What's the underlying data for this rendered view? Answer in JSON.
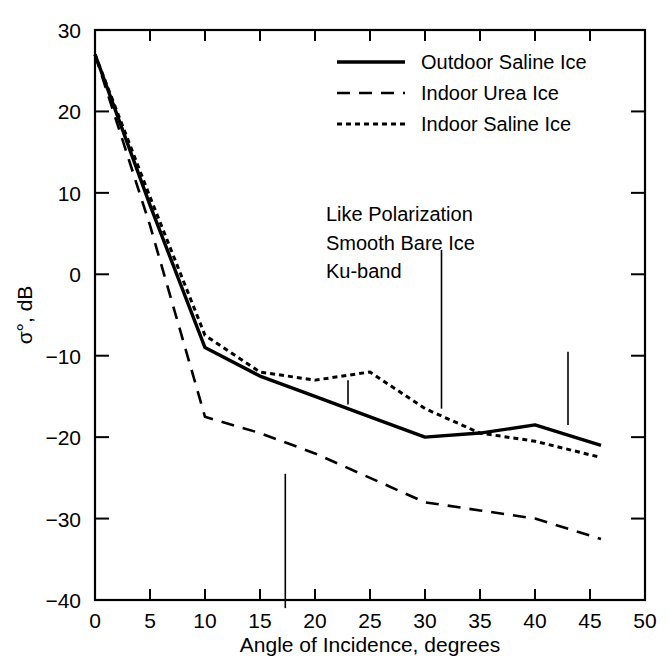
{
  "chart_data": {
    "type": "line",
    "title": "",
    "xlabel": "Angle of Incidence, degrees",
    "ylabel": "σ°, dB",
    "xlim": [
      0,
      50
    ],
    "ylim": [
      -40,
      30
    ],
    "xticks": [
      0,
      5,
      10,
      15,
      20,
      25,
      30,
      35,
      40,
      45,
      50
    ],
    "xticklabels": [
      "0",
      "5",
      "10",
      "15",
      "20",
      "25",
      "30",
      "35",
      "40",
      "45",
      "50"
    ],
    "yticks": [
      -40,
      -30,
      -20,
      -10,
      0,
      10,
      20,
      30
    ],
    "yticklabels": [
      "-40",
      "-30",
      "-20",
      "-10",
      "0",
      "10",
      "20",
      "30"
    ],
    "grid": false,
    "legend_position": "top-right",
    "series": [
      {
        "name": "Outdoor Saline Ice",
        "style": "solid",
        "x": [
          0,
          5,
          10,
          15,
          20,
          25,
          30,
          35,
          40,
          46
        ],
        "y": [
          27.0,
          8.5,
          -9.0,
          -12.5,
          -15.0,
          -17.5,
          -20.0,
          -19.5,
          -18.5,
          -21.0
        ]
      },
      {
        "name": "Indoor Urea Ice",
        "style": "dashed",
        "x": [
          0,
          5,
          10,
          15,
          20,
          25,
          30,
          35,
          40,
          46
        ],
        "y": [
          27.0,
          6.0,
          -17.5,
          -19.5,
          -22.0,
          -25.0,
          -28.0,
          -29.0,
          -30.0,
          -32.5
        ]
      },
      {
        "name": "Indoor Saline Ice",
        "style": "dotted",
        "x": [
          0,
          5,
          10,
          15,
          20,
          25,
          30,
          35,
          40,
          46
        ],
        "y": [
          27.0,
          9.5,
          -7.5,
          -12.0,
          -13.0,
          -12.0,
          -16.5,
          -19.5,
          -20.5,
          -22.5
        ]
      }
    ],
    "error_bars": [
      {
        "x": 17.3,
        "y_top": -24.5,
        "y_bottom": -41.0
      },
      {
        "x": 23.0,
        "y_top": -13.0,
        "y_bottom": -16.0
      },
      {
        "x": 31.5,
        "y_top": 3.0,
        "y_bottom": -16.5
      },
      {
        "x": 43.0,
        "y_top": -9.5,
        "y_bottom": -18.5
      }
    ],
    "annotations": [
      {
        "text": "Like Polarization",
        "x": 21.0,
        "y": 6.5
      },
      {
        "text": "Smooth Bare Ice",
        "x": 21.0,
        "y": 3.0
      },
      {
        "text": "Ku-band",
        "x": 21.0,
        "y": -0.5
      }
    ]
  },
  "legend": {
    "items": [
      {
        "label": "Outdoor Saline Ice",
        "style": "solid"
      },
      {
        "label": "Indoor Urea Ice",
        "style": "dashed"
      },
      {
        "label": "Indoor Saline Ice",
        "style": "dotted"
      }
    ]
  },
  "colors": {
    "ink": "#000000",
    "background": "#ffffff"
  }
}
